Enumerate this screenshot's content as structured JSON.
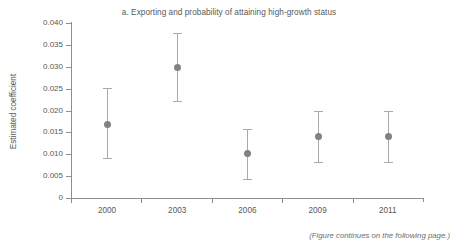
{
  "figure": {
    "title": "a. Exporting and probability of attaining high-growth status",
    "footer_note": "(Figure continues on the following page.)",
    "colors": {
      "text": "#58595b",
      "axis": "#8d8e90",
      "marker": "#808285",
      "error_bar": "#a7a9ac",
      "background": "#ffffff"
    }
  },
  "chart_data": {
    "type": "scatter",
    "title": "a. Exporting and probability of attaining high-growth status",
    "xlabel": "",
    "ylabel": "Estimated coefficient",
    "categories": [
      "2000",
      "2003",
      "2006",
      "2009",
      "2011"
    ],
    "values": [
      0.0168,
      0.0299,
      0.0101,
      0.014,
      0.014
    ],
    "error_low": [
      0.0092,
      0.0221,
      0.0043,
      0.0082,
      0.0082
    ],
    "error_high": [
      0.0251,
      0.0377,
      0.0158,
      0.0199,
      0.0199
    ],
    "series": [
      {
        "name": "Estimated coefficient",
        "points": [
          {
            "x": "2000",
            "y": 0.0168,
            "low": 0.0092,
            "high": 0.0251
          },
          {
            "x": "2003",
            "y": 0.0299,
            "low": 0.0221,
            "high": 0.0377
          },
          {
            "x": "2006",
            "y": 0.0101,
            "low": 0.0043,
            "high": 0.0158
          },
          {
            "x": "2009",
            "y": 0.014,
            "low": 0.0082,
            "high": 0.0199
          },
          {
            "x": "2011",
            "y": 0.014,
            "low": 0.0082,
            "high": 0.0199
          }
        ]
      }
    ],
    "ylim": [
      0,
      0.04
    ],
    "ytick_labels": [
      "0.040",
      "0.035",
      "0.030",
      "0.025",
      "0.020",
      "0.015",
      "0.010",
      "0.005",
      "0"
    ],
    "ytick_values": [
      0.04,
      0.035,
      0.03,
      0.025,
      0.02,
      0.015,
      0.01,
      0.005,
      0
    ],
    "xtick_labels": [
      "2000",
      "2003",
      "2006",
      "2009",
      "2011"
    ],
    "grid": false,
    "legend": null,
    "error_bars": true,
    "annotations": [
      "(Figure continues on the following page.)"
    ]
  }
}
